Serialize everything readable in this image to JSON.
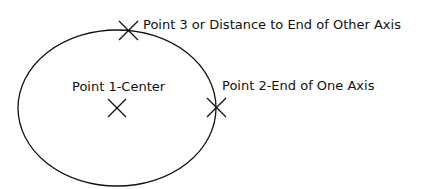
{
  "diagram": {
    "stroke_color": "#111111",
    "ellipse": {
      "cx": 117,
      "cy": 108,
      "rx": 99,
      "ry": 78
    },
    "points": [
      {
        "id": "point-1",
        "label": "Point 1-Center",
        "x": 117,
        "y": 108,
        "label_x": 72,
        "label_y": 79
      },
      {
        "id": "point-2",
        "label": "Point 2-End of One Axis",
        "x": 216,
        "y": 107,
        "label_x": 222,
        "label_y": 79
      },
      {
        "id": "point-3",
        "label": "Point 3 or Distance to End of Other Axis",
        "x": 129,
        "y": 30,
        "label_x": 143,
        "label_y": 18
      }
    ]
  }
}
